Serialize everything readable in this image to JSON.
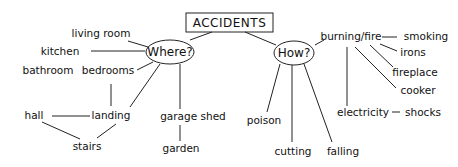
{
  "diagram": {
    "type": "mind-map",
    "root": {
      "id": "accidents",
      "label": "ACCIDENTS",
      "x": 229,
      "y": 22
    },
    "hubs": [
      {
        "id": "where",
        "label": "Where?",
        "x": 170,
        "y": 49
      },
      {
        "id": "how",
        "label": "How?",
        "x": 293,
        "y": 51
      }
    ],
    "nodes": [
      {
        "id": "living-room",
        "label": "living room",
        "x": 101,
        "y": 34
      },
      {
        "id": "kitchen",
        "label": "kitchen",
        "x": 60,
        "y": 52
      },
      {
        "id": "bathroom",
        "label": "bathroom",
        "x": 48,
        "y": 71
      },
      {
        "id": "bedrooms",
        "label": "bedrooms",
        "x": 108,
        "y": 71
      },
      {
        "id": "hall",
        "label": "hall",
        "x": 34,
        "y": 116
      },
      {
        "id": "landing",
        "label": "landing",
        "x": 111,
        "y": 116
      },
      {
        "id": "stairs",
        "label": "stairs",
        "x": 87,
        "y": 147
      },
      {
        "id": "garage-shed",
        "label": "garage shed",
        "x": 193,
        "y": 117
      },
      {
        "id": "garden",
        "label": "garden",
        "x": 181,
        "y": 149
      },
      {
        "id": "burning-fire",
        "label": "burning/fire",
        "x": 347,
        "y": 37
      },
      {
        "id": "smoking",
        "label": "smoking",
        "x": 426,
        "y": 40
      },
      {
        "id": "irons",
        "label": "irons",
        "x": 416,
        "y": 55
      },
      {
        "id": "fireplace",
        "label": "fireplace",
        "x": 410,
        "y": 75
      },
      {
        "id": "cooker",
        "label": "cooker",
        "x": 417,
        "y": 94
      },
      {
        "id": "electricity",
        "label": "electricity",
        "x": 356,
        "y": 114
      },
      {
        "id": "shocks",
        "label": "shocks",
        "x": 423,
        "y": 114
      },
      {
        "id": "poison",
        "label": "poison",
        "x": 264,
        "y": 121
      },
      {
        "id": "cutting",
        "label": "cutting",
        "x": 293,
        "y": 152
      },
      {
        "id": "falling",
        "label": "falling",
        "x": 344,
        "y": 152
      }
    ],
    "edges": [
      [
        "accidents",
        "where"
      ],
      [
        "accidents",
        "how"
      ],
      [
        "where",
        "living-room"
      ],
      [
        "where",
        "kitchen"
      ],
      [
        "where",
        "bedrooms"
      ],
      [
        "where",
        "landing"
      ],
      [
        "where",
        "garage-shed"
      ],
      [
        "bedrooms",
        "landing"
      ],
      [
        "hall",
        "landing"
      ],
      [
        "hall",
        "stairs"
      ],
      [
        "landing",
        "stairs"
      ],
      [
        "garage-shed",
        "garden"
      ],
      [
        "how",
        "burning-fire"
      ],
      [
        "how",
        "poison"
      ],
      [
        "how",
        "cutting"
      ],
      [
        "how",
        "falling"
      ],
      [
        "burning-fire",
        "smoking"
      ],
      [
        "burning-fire",
        "irons"
      ],
      [
        "burning-fire",
        "fireplace"
      ],
      [
        "burning-fire",
        "cooker"
      ],
      [
        "burning-fire",
        "electricity"
      ],
      [
        "electricity",
        "shocks"
      ]
    ],
    "colors": {
      "ink": "#222222",
      "background": "#ffffff"
    }
  }
}
